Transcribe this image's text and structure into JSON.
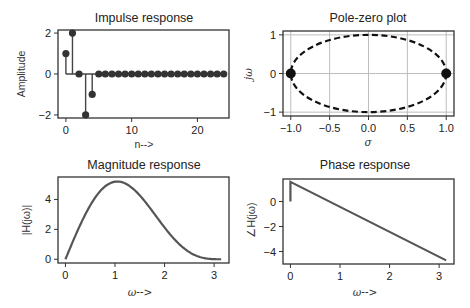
{
  "chart_data": [
    {
      "id": "impulse",
      "type": "stem",
      "title": "Impulse response",
      "xlabel": "n-->",
      "ylabel": "Amplitude",
      "x": [
        0,
        1,
        2,
        3,
        4,
        5,
        6,
        7,
        8,
        9,
        10,
        11,
        12,
        13,
        14,
        15,
        16,
        17,
        18,
        19,
        20,
        21,
        22,
        23,
        24
      ],
      "values": [
        1,
        2,
        0,
        -2,
        -1,
        0,
        0,
        0,
        0,
        0,
        0,
        0,
        0,
        0,
        0,
        0,
        0,
        0,
        0,
        0,
        0,
        0,
        0,
        0,
        0
      ],
      "xticks": [
        "0",
        "10",
        "20"
      ],
      "yticks": [
        "2",
        "0",
        "−2"
      ],
      "xlim": [
        -1.2,
        24.8
      ],
      "ylim": [
        -2.15,
        2.15
      ],
      "grid": false,
      "color": "#444444"
    },
    {
      "id": "polezero",
      "type": "scatter",
      "title": "Pole-zero plot",
      "xlabel": "σ",
      "ylabel": "jω",
      "points": [
        {
          "x": -1.0,
          "y": 0.0
        },
        {
          "x": 1.0,
          "y": 0.0
        }
      ],
      "unit_circle": "dashed",
      "xticks": [
        "−1.0",
        "−0.5",
        "0.0",
        "0.5",
        "1.0"
      ],
      "yticks": [
        "1",
        "0",
        "−1"
      ],
      "xlim": [
        -1.1,
        1.1
      ],
      "ylim": [
        -1.1,
        1.1
      ],
      "grid": true,
      "color": "#111111"
    },
    {
      "id": "magnitude",
      "type": "line",
      "title": "Magnitude response",
      "xlabel": "ω-->",
      "ylabel": "|H(jω)|",
      "coefficients": [
        1,
        2,
        0,
        -2,
        -1
      ],
      "x_range": [
        0,
        3.1416
      ],
      "sample_values": {
        "0": 0.0,
        "0.5": 3.3,
        "1.0": 5.2,
        "1.5": 4.1,
        "2.0": 1.9,
        "2.5": 0.4,
        "3.14": 0.0
      },
      "xticks": [
        "0",
        "1",
        "2",
        "3"
      ],
      "yticks": [
        "0",
        "2",
        "4"
      ],
      "xlim": [
        -0.15,
        3.3
      ],
      "ylim": [
        -0.25,
        5.5
      ],
      "grid": false,
      "color": "#555555"
    },
    {
      "id": "phase",
      "type": "line",
      "title": "Phase response",
      "xlabel": "ω-->",
      "ylabel": "∠H(jω)",
      "x": [
        0,
        0,
        0.02,
        3.1416
      ],
      "values": [
        0,
        1.57,
        1.53,
        -4.71
      ],
      "xticks": [
        "0",
        "1",
        "2",
        "3"
      ],
      "yticks": [
        "0",
        "−2",
        "−4"
      ],
      "xlim": [
        -0.15,
        3.3
      ],
      "ylim": [
        -5.0,
        1.8
      ],
      "grid": false,
      "color": "#555555"
    }
  ]
}
